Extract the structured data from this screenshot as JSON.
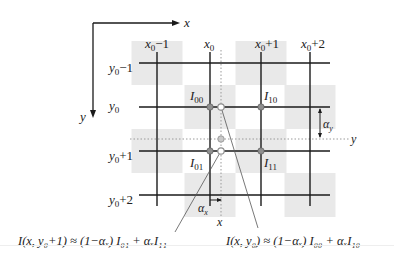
{
  "axes": {
    "x_label": "x",
    "y_label": "y"
  },
  "columns": [
    {
      "base": "x",
      "sub": "0",
      "suffix": "−1"
    },
    {
      "base": "x",
      "sub": "0",
      "suffix": ""
    },
    {
      "base": "x",
      "sub": "0",
      "suffix": "+1"
    },
    {
      "base": "x",
      "sub": "0",
      "suffix": "+2"
    }
  ],
  "rows": [
    {
      "base": "y",
      "sub": "0",
      "suffix": "−1"
    },
    {
      "base": "y",
      "sub": "0",
      "suffix": ""
    },
    {
      "base": "y",
      "sub": "0",
      "suffix": "+1"
    },
    {
      "base": "y",
      "sub": "0",
      "suffix": "+2"
    }
  ],
  "pixels": [
    {
      "base": "I",
      "sub": "00"
    },
    {
      "base": "I",
      "sub": "10"
    },
    {
      "base": "I",
      "sub": "01"
    },
    {
      "base": "I",
      "sub": "11"
    }
  ],
  "sample": {
    "x_label": "x",
    "y_label": "y"
  },
  "offsets": {
    "alpha_x": {
      "base": "α",
      "sub": "x"
    },
    "alpha_y": {
      "base": "α",
      "sub": "y"
    }
  },
  "checker_shaded": [
    [
      0,
      0
    ],
    [
      2,
      0
    ],
    [
      1,
      1
    ],
    [
      3,
      1
    ],
    [
      0,
      2
    ],
    [
      2,
      2
    ],
    [
      1,
      3
    ],
    [
      3,
      3
    ]
  ],
  "colors": {
    "grid": "#1a1a1a",
    "shade": "#e9e9e9",
    "dot": "#8f8f8f",
    "dotted": "#9a9a9a"
  },
  "equations": {
    "left": "I(x, y₀+1) ≈ (1−αₓ) I₀₁ + αₓI₁₁",
    "right": "I(x, y₀) ≈ (1−αₓ) I₀₀ + αₓI₁₀"
  }
}
